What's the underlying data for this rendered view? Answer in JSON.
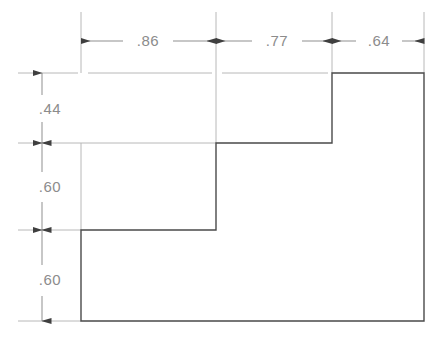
{
  "drawing": {
    "title": "Stepped profile dimensioned drawing",
    "units_note": "",
    "colors": {
      "object_line": "#4a4a4a",
      "extension_line": "#b8b8b8",
      "dimension_line": "#8f8f8f",
      "arrow": "#3f3f3f",
      "text": "#8c8c8c",
      "background": "#ffffff"
    },
    "horizontal_dimensions": [
      {
        "id": "dim-h-1",
        "label": ".86",
        "from_x": 81,
        "to_x": 216,
        "text_x": 148,
        "text_y": 46
      },
      {
        "id": "dim-h-2",
        "label": ".77",
        "from_x": 216,
        "to_x": 332,
        "text_x": 277,
        "text_y": 46
      },
      {
        "id": "dim-h-3",
        "label": ".64",
        "from_x": 332,
        "to_x": 424,
        "text_x": 379,
        "text_y": 46
      }
    ],
    "vertical_dimensions": [
      {
        "id": "dim-v-1",
        "label": ".44",
        "from_y": 73,
        "to_y": 143,
        "text_x": 50,
        "text_y": 114
      },
      {
        "id": "dim-v-2",
        "label": ".60",
        "from_y": 143,
        "to_y": 230,
        "text_x": 50,
        "text_y": 192
      },
      {
        "id": "dim-v-3",
        "label": ".60",
        "from_y": 230,
        "to_y": 321,
        "text_x": 50,
        "text_y": 285
      }
    ],
    "profile": {
      "description": "Three-step ascending L-shaped profile",
      "points": "81,230 216,230 216,143 332,143 332,73 424,73 424,321 81,321 81,230",
      "steps": [
        {
          "id": "step-1",
          "x_start": 81,
          "x_end": 216,
          "top_y": 230
        },
        {
          "id": "step-2",
          "x_start": 216,
          "x_end": 332,
          "top_y": 143
        },
        {
          "id": "step-3",
          "x_start": 332,
          "x_end": 424,
          "top_y": 73
        }
      ]
    }
  }
}
